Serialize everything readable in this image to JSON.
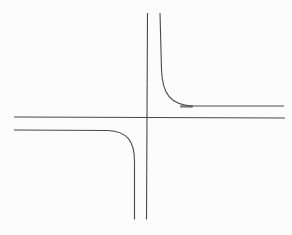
{
  "figure": {
    "canvas": {
      "width": 292,
      "height": 235
    },
    "colors": {
      "background": "#fcfcfc",
      "stroke": "#4a4a4a"
    },
    "asymptotes": {
      "vertical": {
        "x": 147,
        "y_top": 13,
        "y_bottom": 220,
        "d": "M 147.5 13 L 146.5 219.5"
      },
      "horizontal": {
        "y": 117.5,
        "x_left": 14,
        "x_right": 285,
        "d": "M 14 117 L 285 118"
      }
    },
    "branches": {
      "upper_right": {
        "quadrant": "upper-right of asymptote crossing",
        "d": "M 160 13 L 161.5 70 C 162.5 93 169.5 105.5 194 106 L 284 106"
      },
      "lower_left": {
        "quadrant": "lower-left of asymptote crossing",
        "d": "M 14 130 L 108 130.5 C 127 131.5 134.5 141 134.5 161 L 134.5 219.5"
      }
    },
    "ink_mark": {
      "d": "M 181 106.4 L 192 106.6"
    }
  }
}
